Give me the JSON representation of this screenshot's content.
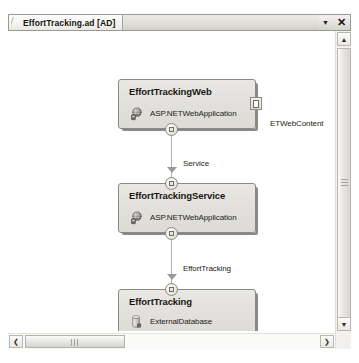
{
  "tab": {
    "title": "EffortTracking.ad [AD]",
    "dropdown_icon": "chevron-down-icon",
    "close_icon": "close-icon"
  },
  "diagram": {
    "nodes": [
      {
        "id": "web",
        "title": "EffortTrackingWeb",
        "type": "ASP.NETWebApplication",
        "icon": "web-application-icon",
        "endpoint_icon": "provider-endpoint-icon"
      },
      {
        "id": "service",
        "title": "EffortTrackingService",
        "type": "ASP.NETWebApplication",
        "icon": "web-application-icon"
      },
      {
        "id": "database",
        "title": "EffortTracking",
        "type": "ExternalDatabase",
        "icon": "database-icon"
      }
    ],
    "connector_labels": [
      {
        "id": "service-conn",
        "text": "Service"
      },
      {
        "id": "efforttracking-conn",
        "text": "EffortTracking"
      }
    ],
    "free_labels": [
      {
        "id": "etwebcontent",
        "text": "ETWebContent"
      }
    ]
  },
  "scrollbars": {
    "vertical": {
      "up_icon": "scroll-up-icon",
      "down_icon": "scroll-down-icon"
    },
    "horizontal": {
      "left_icon": "scroll-left-icon",
      "right_icon": "scroll-right-icon"
    }
  },
  "glyphs": {
    "chevron_down": "▼",
    "close": "✕",
    "arrow_up": "▲",
    "arrow_down": "▼",
    "arrow_left": "❮",
    "arrow_right": "❯"
  }
}
